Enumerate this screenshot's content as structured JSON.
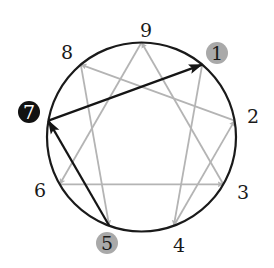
{
  "diagram": {
    "circle": {
      "cx": 141.5,
      "cy": 137,
      "r": 94.5,
      "stroke": "#1a1a1a"
    },
    "colors": {
      "gray_line": "#b4b4b4",
      "black_line": "#151515",
      "gray_badge": "#a9a9a9",
      "black_badge": "#111111",
      "label_text": "#1a1a1a",
      "black_badge_text": "#ffffff"
    },
    "points": [
      {
        "id": "9",
        "label": "9",
        "x": 141.5,
        "y": 42.5,
        "lx": 146,
        "ly": 30,
        "badge": "none"
      },
      {
        "id": "1",
        "label": "1",
        "x": 202.2,
        "y": 64.6,
        "lx": 217,
        "ly": 53,
        "badge": "gray"
      },
      {
        "id": "2",
        "label": "2",
        "x": 234.6,
        "y": 120.6,
        "lx": 253,
        "ly": 116,
        "badge": "none"
      },
      {
        "id": "3",
        "label": "3",
        "x": 223.3,
        "y": 184.3,
        "lx": 243,
        "ly": 192,
        "badge": "none"
      },
      {
        "id": "4",
        "label": "4",
        "x": 173.8,
        "y": 225.8,
        "lx": 179,
        "ly": 245,
        "badge": "none"
      },
      {
        "id": "5",
        "label": "5",
        "x": 109.2,
        "y": 225.8,
        "lx": 107,
        "ly": 243,
        "badge": "gray"
      },
      {
        "id": "6",
        "label": "6",
        "x": 59.7,
        "y": 184.3,
        "lx": 40,
        "ly": 190,
        "badge": "none"
      },
      {
        "id": "7",
        "label": "7",
        "x": 48.4,
        "y": 120.6,
        "lx": 29,
        "ly": 112,
        "badge": "black"
      },
      {
        "id": "8",
        "label": "8",
        "x": 80.8,
        "y": 64.6,
        "lx": 67,
        "ly": 52,
        "badge": "none"
      }
    ],
    "arrows": [
      {
        "from": "1",
        "to": "4",
        "style": "gray"
      },
      {
        "from": "4",
        "to": "2",
        "style": "gray"
      },
      {
        "from": "2",
        "to": "8",
        "style": "gray"
      },
      {
        "from": "8",
        "to": "5",
        "style": "gray"
      },
      {
        "from": "3",
        "to": "9",
        "style": "gray"
      },
      {
        "from": "9",
        "to": "6",
        "style": "gray"
      },
      {
        "from": "6",
        "to": "3",
        "style": "gray"
      },
      {
        "from": "5",
        "to": "7",
        "style": "black"
      },
      {
        "from": "7",
        "to": "1",
        "style": "black"
      }
    ]
  }
}
